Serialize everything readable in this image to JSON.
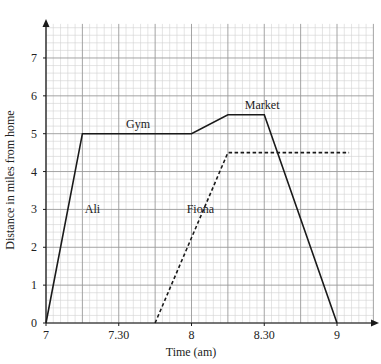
{
  "chart_data": {
    "type": "line",
    "title": "",
    "xlabel": "Time (am)",
    "ylabel": "Distance in miles from home",
    "x_unit": "minutes after 7:00",
    "x_ticks": [
      {
        "t": 0,
        "label": "7"
      },
      {
        "t": 30,
        "label": "7.30"
      },
      {
        "t": 60,
        "label": "8"
      },
      {
        "t": 90,
        "label": "8.30"
      },
      {
        "t": 120,
        "label": "9"
      }
    ],
    "y_ticks": [
      0,
      1,
      2,
      3,
      4,
      5,
      6,
      7
    ],
    "xlim": [
      0,
      135
    ],
    "ylim": [
      0,
      7.9
    ],
    "grid": true,
    "grid_major": {
      "x": 15,
      "y": 1
    },
    "grid_minor": {
      "x": 3,
      "y": 0.2
    },
    "legend": "none (inline labels)",
    "series": [
      {
        "name": "Ali",
        "style": "solid",
        "points": [
          {
            "time": "7:00",
            "t": 0,
            "d": 0
          },
          {
            "time": "7:15",
            "t": 15,
            "d": 5
          },
          {
            "time": "8:00",
            "t": 60,
            "d": 5
          },
          {
            "time": "8:15",
            "t": 75,
            "d": 5.5
          },
          {
            "time": "8:30",
            "t": 90,
            "d": 5.5
          },
          {
            "time": "9:00",
            "t": 120,
            "d": 0
          }
        ]
      },
      {
        "name": "Fiona",
        "style": "dashed",
        "points": [
          {
            "time": "7:45",
            "t": 45,
            "d": 0
          },
          {
            "time": "8:15",
            "t": 75,
            "d": 4.5
          },
          {
            "time": "9:05",
            "t": 125,
            "d": 4.5
          }
        ]
      }
    ],
    "annotations": [
      {
        "text": "Ali",
        "t": 16,
        "d": 3
      },
      {
        "text": "Gym",
        "t": 33,
        "d": 5.25
      },
      {
        "text": "Market",
        "t": 82,
        "d": 5.75
      },
      {
        "text": "Fiona",
        "t": 58,
        "d": 3
      }
    ]
  },
  "labels": {
    "xlabel": "Time (am)",
    "ylabel": "Distance in miles from home",
    "ali": "Ali",
    "fiona": "Fiona",
    "gym": "Gym",
    "market": "Market"
  },
  "colors": {
    "line": "#1a1a1a",
    "grid_major": "#9a9a9a",
    "grid_minor": "#d2d2d2",
    "text": "#222222"
  }
}
